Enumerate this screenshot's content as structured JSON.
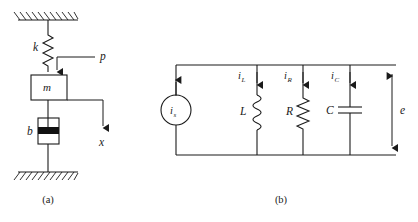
{
  "figure": {
    "panels": [
      {
        "id": "mechanical",
        "caption": "(a)",
        "labels": {
          "spring": "k",
          "mass": "m",
          "damper": "b",
          "force": "p",
          "displacement": "x"
        }
      },
      {
        "id": "electrical",
        "caption": "(b)",
        "labels": {
          "source_base": "i",
          "source_sub": "s",
          "inductor": "L",
          "resistor": "R",
          "capacitor": "C",
          "voltage": "e",
          "current_inductor_base": "i",
          "current_inductor_sub": "L",
          "current_resistor_base": "i",
          "current_resistor_sub": "R",
          "current_capacitor_base": "i",
          "current_capacitor_sub": "C"
        }
      }
    ],
    "colors": {
      "ink": "#1a1a1a",
      "background": "#ffffff",
      "piston_fill": "#111111"
    }
  }
}
